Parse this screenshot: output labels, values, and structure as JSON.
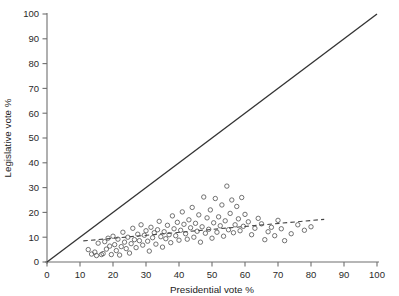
{
  "chart_data": {
    "type": "scatter",
    "title": "",
    "xlabel": "Presidential vote %",
    "ylabel": "Legislative vote %",
    "xlim": [
      0,
      100
    ],
    "ylim": [
      0,
      100
    ],
    "xticks": [
      0,
      10,
      20,
      30,
      40,
      50,
      60,
      70,
      80,
      90,
      100
    ],
    "yticks": [
      0,
      10,
      20,
      30,
      40,
      50,
      60,
      70,
      80,
      90,
      100
    ],
    "grid": false,
    "legend": null,
    "marker": "open-circle",
    "marker_color": "#5a5a5a",
    "reference_line": {
      "name": "identity-line",
      "style": "solid",
      "color": "#333333",
      "x": [
        0,
        100
      ],
      "y": [
        0,
        100
      ]
    },
    "fit_line": {
      "name": "regression-line",
      "style": "dashed",
      "color": "#444444",
      "x": [
        11,
        84
      ],
      "y": [
        8.5,
        17.2
      ]
    },
    "points": [
      [
        12.5,
        5.0
      ],
      [
        13.5,
        3.2
      ],
      [
        14.5,
        4.0
      ],
      [
        15.0,
        2.6
      ],
      [
        15.5,
        7.6
      ],
      [
        16.5,
        3.0
      ],
      [
        17.0,
        3.4
      ],
      [
        17.5,
        8.2
      ],
      [
        18.0,
        5.2
      ],
      [
        18.5,
        9.6
      ],
      [
        19.0,
        6.4
      ],
      [
        19.5,
        3.0
      ],
      [
        20.0,
        10.4
      ],
      [
        20.5,
        7.0
      ],
      [
        21.0,
        4.6
      ],
      [
        21.5,
        9.2
      ],
      [
        22.0,
        2.8
      ],
      [
        22.5,
        6.2
      ],
      [
        23.0,
        12.0
      ],
      [
        23.5,
        8.0
      ],
      [
        24.0,
        5.4
      ],
      [
        24.5,
        10.0
      ],
      [
        25.0,
        3.6
      ],
      [
        25.5,
        7.4
      ],
      [
        26.0,
        13.6
      ],
      [
        26.5,
        9.0
      ],
      [
        27.0,
        5.8
      ],
      [
        27.5,
        11.2
      ],
      [
        28.0,
        8.6
      ],
      [
        28.5,
        15.0
      ],
      [
        29.0,
        6.8
      ],
      [
        29.5,
        10.8
      ],
      [
        30.0,
        12.6
      ],
      [
        30.5,
        8.4
      ],
      [
        31.0,
        4.4
      ],
      [
        31.5,
        14.0
      ],
      [
        32.0,
        9.8
      ],
      [
        32.5,
        11.8
      ],
      [
        33.0,
        7.2
      ],
      [
        33.5,
        13.0
      ],
      [
        34.0,
        16.4
      ],
      [
        34.5,
        10.2
      ],
      [
        35.0,
        6.0
      ],
      [
        35.5,
        12.2
      ],
      [
        36.0,
        9.4
      ],
      [
        36.5,
        14.8
      ],
      [
        37.0,
        11.0
      ],
      [
        37.5,
        7.8
      ],
      [
        38.0,
        18.6
      ],
      [
        38.5,
        13.4
      ],
      [
        39.0,
        10.6
      ],
      [
        39.5,
        16.0
      ],
      [
        40.0,
        8.8
      ],
      [
        40.5,
        12.8
      ],
      [
        41.0,
        20.2
      ],
      [
        41.5,
        15.2
      ],
      [
        42.0,
        11.4
      ],
      [
        42.5,
        9.2
      ],
      [
        43.0,
        17.0
      ],
      [
        43.5,
        13.8
      ],
      [
        44.0,
        22.0
      ],
      [
        44.5,
        10.0
      ],
      [
        45.0,
        15.6
      ],
      [
        45.5,
        12.4
      ],
      [
        46.0,
        19.0
      ],
      [
        46.5,
        8.0
      ],
      [
        47.0,
        14.2
      ],
      [
        47.5,
        26.2
      ],
      [
        48.0,
        11.6
      ],
      [
        48.5,
        17.8
      ],
      [
        49.0,
        13.2
      ],
      [
        49.5,
        21.0
      ],
      [
        50.0,
        9.6
      ],
      [
        50.5,
        15.8
      ],
      [
        51.0,
        25.6
      ],
      [
        51.5,
        12.0
      ],
      [
        52.0,
        18.2
      ],
      [
        52.5,
        14.6
      ],
      [
        53.0,
        23.0
      ],
      [
        53.5,
        10.4
      ],
      [
        54.0,
        16.6
      ],
      [
        54.5,
        30.6
      ],
      [
        55.0,
        13.0
      ],
      [
        55.5,
        19.6
      ],
      [
        56.0,
        25.0
      ],
      [
        56.5,
        11.8
      ],
      [
        57.0,
        15.0
      ],
      [
        57.5,
        22.4
      ],
      [
        58.0,
        17.4
      ],
      [
        58.5,
        12.6
      ],
      [
        59.0,
        26.0
      ],
      [
        59.5,
        14.4
      ],
      [
        60.0,
        19.2
      ],
      [
        61.0,
        16.2
      ],
      [
        62.0,
        11.0
      ],
      [
        63.0,
        13.6
      ],
      [
        64.0,
        17.6
      ],
      [
        65.0,
        15.4
      ],
      [
        66.0,
        9.0
      ],
      [
        67.0,
        12.2
      ],
      [
        68.0,
        14.0
      ],
      [
        69.0,
        10.6
      ],
      [
        70.0,
        16.8
      ],
      [
        71.0,
        13.4
      ],
      [
        72.0,
        8.6
      ],
      [
        74.0,
        11.4
      ],
      [
        76.0,
        15.0
      ],
      [
        78.0,
        12.8
      ],
      [
        80.0,
        14.2
      ]
    ]
  },
  "axes": {
    "x_title": "Presidential vote %",
    "y_title": "Legislative vote %"
  }
}
